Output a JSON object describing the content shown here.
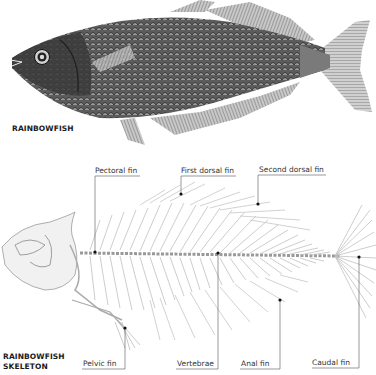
{
  "fish": {
    "title": "RAINBOWFISH"
  },
  "skeleton": {
    "title_line1": "RAINBOWFISH",
    "title_line2": "SKELETON",
    "labels": {
      "pectoral_fin": "Pectoral fin",
      "first_dorsal_fin": "First dorsal fin",
      "second_dorsal_fin": "Second dorsal fin",
      "pelvic_fin": "Pelvic fin",
      "vertebrae": "Vertebrae",
      "anal_fin": "Anal fin",
      "caudal_fin": "Caudal fin"
    }
  },
  "colors": {
    "fish_dark": "#2e2e2e",
    "fish_mid": "#6a6a6a",
    "bone": "#b5b5b5",
    "leader": "#555555"
  }
}
